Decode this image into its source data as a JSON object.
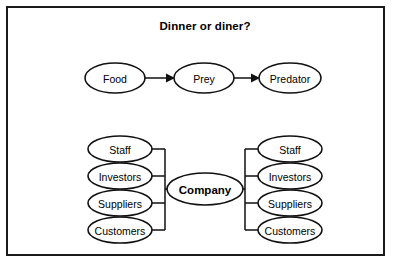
{
  "figure": {
    "title": "Dinner or diner?",
    "border_color": "#1a1a1a",
    "background_color": "#ffffff",
    "stroke_color": "#111111"
  },
  "food_chain": {
    "nodes": [
      {
        "label": "Food"
      },
      {
        "label": "Prey"
      },
      {
        "label": "Predator"
      }
    ],
    "arrows": [
      {
        "from": "Food",
        "to": "Prey"
      },
      {
        "from": "Prey",
        "to": "Predator"
      }
    ]
  },
  "company_diagram": {
    "center": {
      "label": "Company"
    },
    "left_stack": [
      {
        "label": "Staff"
      },
      {
        "label": "Investors"
      },
      {
        "label": "Suppliers"
      },
      {
        "label": "Customers"
      }
    ],
    "right_stack": [
      {
        "label": "Staff"
      },
      {
        "label": "Investors"
      },
      {
        "label": "Suppliers"
      },
      {
        "label": "Customers"
      }
    ],
    "arrows": [
      {
        "direction": "right",
        "target": "Company"
      },
      {
        "direction": "left",
        "target": "Company"
      }
    ]
  }
}
